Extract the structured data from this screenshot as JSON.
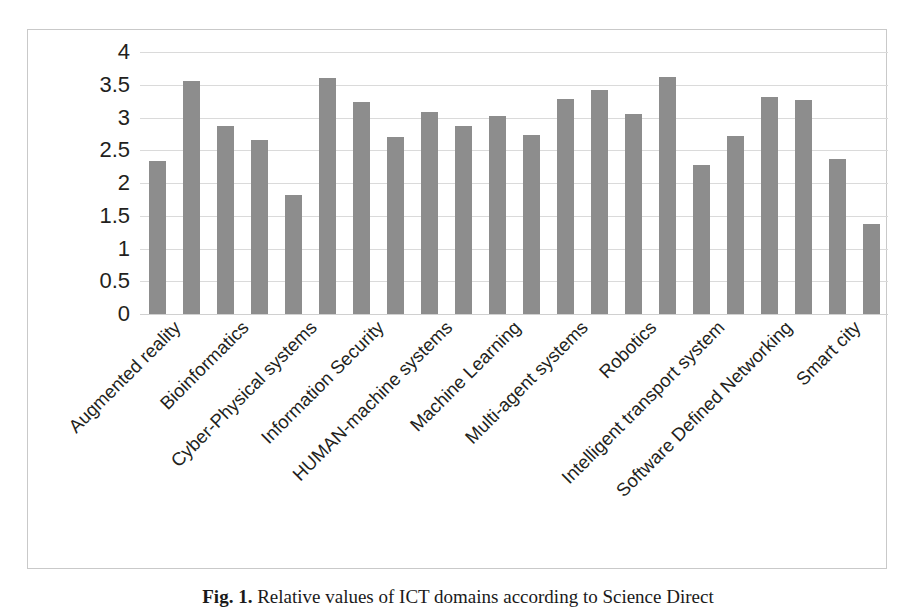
{
  "figure": {
    "caption_label": "Fig. 1.",
    "caption_text": "Relative values of ICT domains according to Science Direct"
  },
  "chart_data": {
    "type": "bar",
    "title": "",
    "xlabel": "",
    "ylabel": "",
    "ylim": [
      0,
      4
    ],
    "yticks": [
      "0",
      "0.5",
      "1",
      "1.5",
      "2",
      "2.5",
      "3",
      "3.5",
      "4"
    ],
    "ytick_values": [
      0,
      0.5,
      1,
      1.5,
      2,
      2.5,
      3,
      3.5,
      4
    ],
    "grid": true,
    "legend": false,
    "bar_color": "#8d8d8d",
    "gridline_color": "#dadada",
    "label_rotation_deg": -45,
    "categories": [
      "Augmented reality",
      "",
      "Bioinformatics",
      "",
      "Cyber-Physical systems",
      "",
      "Information Security",
      "",
      "HUMAN-machine systems",
      "",
      "Machine Learning",
      "",
      "Multi-agent systems",
      "",
      "Robotics",
      "",
      "Intelligent transport system",
      "",
      "Software Defined Networking",
      "",
      "Smart city",
      ""
    ],
    "visible_labels": [
      "Augmented reality",
      "Bioinformatics",
      "Cyber-Physical systems",
      "Information Security",
      "HUMAN-machine systems",
      "Machine Learning",
      "Multi-agent systems",
      "Robotics",
      "Intelligent transport system",
      "Software Defined Networking",
      "Smart city"
    ],
    "values": [
      2.33,
      3.56,
      2.87,
      2.65,
      1.82,
      3.61,
      3.23,
      2.7,
      3.09,
      2.87,
      3.03,
      2.73,
      3.28,
      3.42,
      3.05,
      3.62,
      2.27,
      2.72,
      3.32,
      3.27,
      2.36,
      1.37
    ]
  }
}
